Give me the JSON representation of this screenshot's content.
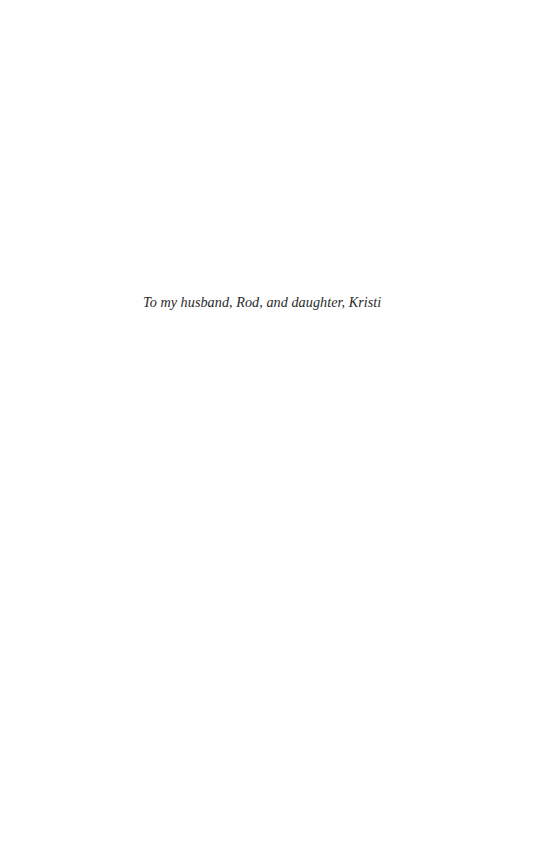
{
  "page": {
    "dedication": "To my husband, Rod, and daughter, Kristi"
  }
}
